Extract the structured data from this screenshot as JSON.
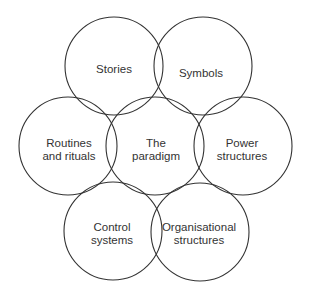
{
  "diagram": {
    "stroke_color": "#333333",
    "nodes": [
      {
        "id": "stories",
        "lines": [
          "Stories"
        ],
        "cx": 114,
        "cy": 66,
        "r": 49,
        "tx": 114,
        "ty": 69
      },
      {
        "id": "symbols",
        "lines": [
          "Symbols"
        ],
        "cx": 203,
        "cy": 66,
        "r": 49,
        "tx": 201,
        "ty": 73
      },
      {
        "id": "routines",
        "lines": [
          "Routines",
          "and rituals"
        ],
        "cx": 68,
        "cy": 146,
        "r": 49,
        "tx": 69,
        "ty": 150
      },
      {
        "id": "paradigm",
        "lines": [
          "The",
          "paradigm"
        ],
        "cx": 155,
        "cy": 146,
        "r": 49,
        "tx": 156,
        "ty": 150
      },
      {
        "id": "power",
        "lines": [
          "Power",
          "structures"
        ],
        "cx": 243,
        "cy": 146,
        "r": 49,
        "tx": 242,
        "ty": 150
      },
      {
        "id": "control",
        "lines": [
          "Control",
          "systems"
        ],
        "cx": 113,
        "cy": 231,
        "r": 49,
        "tx": 112,
        "ty": 234
      },
      {
        "id": "organisational",
        "lines": [
          "Organisational",
          "structures"
        ],
        "cx": 200,
        "cy": 232,
        "r": 49,
        "tx": 199,
        "ty": 234
      }
    ]
  }
}
